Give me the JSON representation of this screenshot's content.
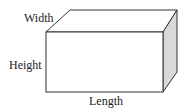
{
  "diagram": {
    "labels": {
      "width": "Width",
      "height": "Height",
      "length": "Length"
    },
    "colors": {
      "edge": "#333333",
      "side_face": "#d9d9d9",
      "face": "#ffffff"
    }
  }
}
